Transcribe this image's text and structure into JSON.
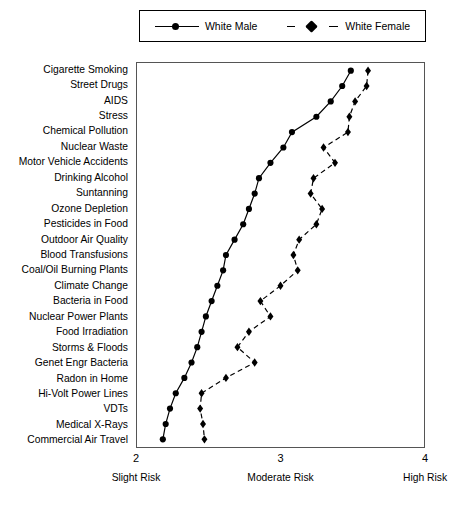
{
  "legend": {
    "position": "top",
    "entries": [
      {
        "label": "White Male",
        "marker": "circle-marker-icon",
        "line": "solid"
      },
      {
        "label": "White Female",
        "marker": "diamond-marker-icon",
        "line": "dashed"
      }
    ]
  },
  "axis": {
    "x_ticks": [
      "2",
      "3",
      "4"
    ],
    "x_captions": [
      "Slight Risk",
      "Moderate Risk",
      "High Risk"
    ]
  },
  "chart_data": {
    "type": "line",
    "title": "",
    "xlabel": "",
    "ylabel": "",
    "xlim": [
      2,
      4
    ],
    "grid": false,
    "legend_position": "top",
    "orientation": "horizontal",
    "categories": [
      "Cigarette Smoking",
      "Street Drugs",
      "AIDS",
      "Stress",
      "Chemical Pollution",
      "Nuclear Waste",
      "Motor Vehicle Accidents",
      "Drinking Alcohol",
      "Suntanning",
      "Ozone Depletion",
      "Pesticides in Food",
      "Outdoor Air Quality",
      "Blood Transfusions",
      "Coal/Oil Burning Plants",
      "Climate Change",
      "Bacteria in Food",
      "Nuclear Power Plants",
      "Food Irradiation",
      "Storms & Floods",
      "Genet Engr Bacteria",
      "Radon in Home",
      "Hi-Volt Power Lines",
      "VDTs",
      "Medical X-Rays",
      "Commercial Air Travel"
    ],
    "series": [
      {
        "name": "White Male",
        "marker": "circle",
        "line": "solid",
        "values": [
          3.49,
          3.43,
          3.35,
          3.25,
          3.08,
          3.02,
          2.93,
          2.85,
          2.82,
          2.78,
          2.74,
          2.68,
          2.62,
          2.6,
          2.56,
          2.52,
          2.48,
          2.45,
          2.42,
          2.38,
          2.33,
          2.27,
          2.23,
          2.2,
          2.18
        ]
      },
      {
        "name": "White Female",
        "marker": "diamond",
        "line": "dashed",
        "values": [
          3.61,
          3.6,
          3.52,
          3.48,
          3.47,
          3.3,
          3.38,
          3.23,
          3.21,
          3.29,
          3.25,
          3.13,
          3.09,
          3.12,
          3.0,
          2.86,
          2.93,
          2.78,
          2.7,
          2.82,
          2.62,
          2.45,
          2.44,
          2.46,
          2.47
        ]
      }
    ]
  }
}
